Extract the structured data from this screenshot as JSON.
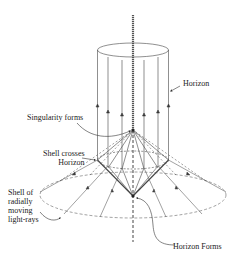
{
  "diagram": {
    "type": "spacetime-collapse-diagram",
    "labels": {
      "horizon": "Horizon",
      "singularity_forms": "Singularity forms",
      "shell_crosses_line1": "Shell crosses",
      "shell_crosses_line2": "Horizon",
      "shell_line1": "Shell of",
      "shell_line2": "radially",
      "shell_line3": "moving",
      "shell_line4": "light-rays",
      "horizon_forms": "Horizon Forms"
    },
    "colors": {
      "ink": "#333333",
      "axis": "#555555",
      "background": "#ffffff"
    }
  }
}
